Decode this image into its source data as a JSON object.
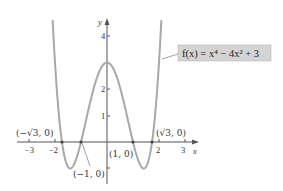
{
  "chart_data": {
    "type": "line",
    "title": "",
    "function_label": "f(x) = x⁴ − 4x² + 3",
    "xlabel": "x",
    "ylabel": "y",
    "xlim": [
      -3.5,
      3.5
    ],
    "ylim": [
      -1.6,
      4.4
    ],
    "x_ticks": [
      -3,
      -2,
      2,
      3
    ],
    "x_tick_labels": [
      "−3",
      "−2",
      "2",
      "3"
    ],
    "y_ticks": [
      1,
      2,
      4
    ],
    "y_tick_labels": [
      "1",
      "2",
      "4"
    ],
    "grid": false,
    "series": [
      {
        "name": "f(x) = x^4 - 4x^2 + 3",
        "color": "#a8a8a8",
        "formula": "x^4 - 4x^2 + 3"
      }
    ],
    "annotations": [
      {
        "label": "(−√3, 0)",
        "x": -1.732,
        "y": 0
      },
      {
        "label": "(−1, 0)",
        "x": -1,
        "y": 0
      },
      {
        "label": "(1, 0)",
        "x": 1,
        "y": 0
      },
      {
        "label": "(√3, 0)",
        "x": 1.732,
        "y": 0
      }
    ],
    "key_points": {
      "zeros": [
        -1.732,
        -1,
        1,
        1.732
      ],
      "local_max": [
        0,
        3
      ],
      "local_min": [
        [
          -1.414,
          -1
        ],
        [
          1.414,
          -1
        ]
      ]
    }
  },
  "labels": {
    "x_axis": "x",
    "y_axis": "y",
    "function": "f(x) = x⁴ − 4x² + 3",
    "zero_neg_sqrt3": "(−√3, 0)",
    "zero_neg1": "(−1, 0)",
    "zero_pos1": "(1, 0)",
    "zero_pos_sqrt3": "(√3, 0)",
    "tick_x_neg3": "−3",
    "tick_x_neg2": "−2",
    "tick_x_2": "2",
    "tick_x_3": "3",
    "tick_y_1": "1",
    "tick_y_2": "2",
    "tick_y_4": "4"
  },
  "colors": {
    "curve": "#a8a8a8",
    "axis": "#555555",
    "label_box": "#d4d4d4"
  }
}
